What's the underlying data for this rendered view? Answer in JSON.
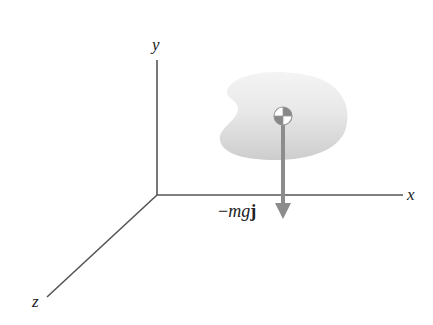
{
  "diagram": {
    "type": "3d-coordinate-free-body",
    "axes": {
      "x": {
        "label": "x"
      },
      "y": {
        "label": "y"
      },
      "z": {
        "label": "z"
      }
    },
    "body": {
      "shape": "irregular-blob",
      "center_of_mass_symbol": "center-of-mass"
    },
    "force": {
      "label_prefix": "−",
      "label_italic": "mg",
      "label_bold": "j",
      "direction": "down"
    },
    "colors": {
      "axis": "#555555",
      "arrow": "#8c8c8c",
      "blob_light": "#f2f2f2",
      "blob_dark": "#cfcfcf",
      "com_dark": "#888888"
    }
  }
}
